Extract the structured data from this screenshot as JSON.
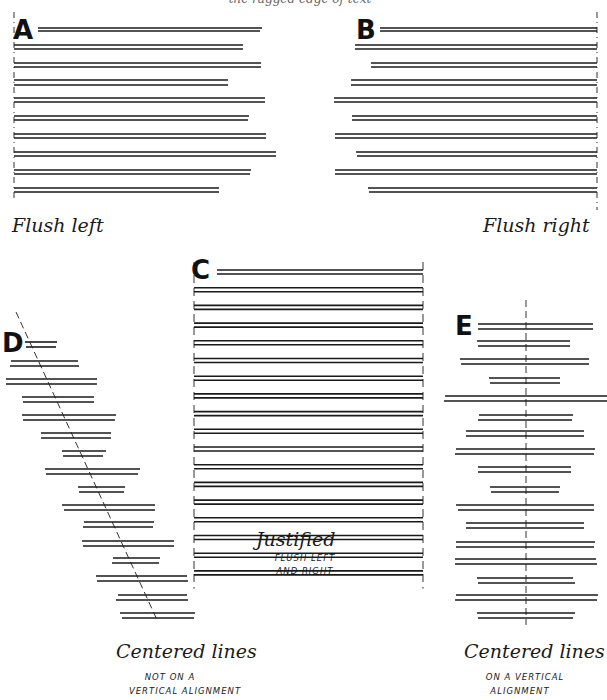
{
  "top_caption": "the ragged edge of text",
  "panels": {
    "A": {
      "letter": "A",
      "title": "Flush left",
      "align": "left",
      "axis_x": 14,
      "axis_y": [
        12,
        200
      ],
      "lines": [
        [
          [
            38,
            262,
            28
          ],
          [
            38,
            260,
            31
          ]
        ],
        [
          [
            14,
            243,
            45
          ],
          [
            14,
            243,
            49
          ]
        ],
        [
          [
            14,
            261,
            63
          ],
          [
            14,
            261,
            67
          ]
        ],
        [
          [
            14,
            228,
            80
          ],
          [
            14,
            228,
            85
          ]
        ],
        [
          [
            14,
            265,
            98
          ],
          [
            14,
            265,
            102
          ]
        ],
        [
          [
            14,
            249,
            116
          ],
          [
            14,
            248,
            120
          ]
        ],
        [
          [
            14,
            266,
            134
          ],
          [
            14,
            266,
            138
          ]
        ],
        [
          [
            14,
            276,
            152
          ],
          [
            14,
            276,
            156
          ]
        ],
        [
          [
            14,
            251,
            170
          ],
          [
            14,
            250,
            174
          ]
        ],
        [
          [
            14,
            219,
            188
          ],
          [
            14,
            219,
            192
          ]
        ]
      ]
    },
    "B": {
      "letter": "B",
      "title": "Flush right",
      "align": "right",
      "axis_x": 597,
      "axis_y": [
        12,
        210
      ],
      "lines": [
        [
          [
            380,
            597,
            28
          ],
          [
            380,
            597,
            31
          ]
        ],
        [
          [
            355,
            597,
            45
          ],
          [
            355,
            597,
            49
          ]
        ],
        [
          [
            371,
            597,
            63
          ],
          [
            371,
            597,
            67
          ]
        ],
        [
          [
            351,
            597,
            80
          ],
          [
            351,
            597,
            85
          ]
        ],
        [
          [
            334,
            597,
            98
          ],
          [
            334,
            597,
            102
          ]
        ],
        [
          [
            352,
            597,
            116
          ],
          [
            352,
            597,
            120
          ]
        ],
        [
          [
            335,
            597,
            134
          ],
          [
            335,
            597,
            138
          ]
        ],
        [
          [
            356,
            597,
            152
          ],
          [
            357,
            597,
            156
          ]
        ],
        [
          [
            335,
            597,
            170
          ],
          [
            335,
            597,
            174
          ]
        ],
        [
          [
            368,
            597,
            188
          ],
          [
            369,
            597,
            192
          ]
        ]
      ]
    },
    "C": {
      "letter": "C",
      "title": "Justified",
      "subtitle_lines": [
        "FLUSH LEFT",
        "AND RIGHT"
      ],
      "align": "justified",
      "left_x": 194,
      "right_x": 423,
      "lines_count": 18,
      "first_y": 270,
      "spacing": 17.7
    },
    "D": {
      "letter": "D",
      "title": "Centered lines",
      "subtitle_lines": [
        "NOT ON A",
        "VERTICAL ALIGNMENT"
      ],
      "align": "centered-diagonal",
      "axis": [
        [
          16,
          312
        ],
        [
          158,
          622
        ]
      ],
      "lines": [
        [
          [
            25,
            57,
            342
          ],
          [
            26,
            56,
            347
          ]
        ],
        [
          [
            11,
            78,
            361
          ],
          [
            10,
            79,
            366
          ]
        ],
        [
          [
            6,
            97,
            379
          ],
          [
            6,
            97,
            384
          ]
        ],
        [
          [
            22,
            94,
            397
          ],
          [
            23,
            94,
            402
          ]
        ],
        [
          [
            22,
            116,
            415
          ],
          [
            23,
            115,
            420
          ]
        ],
        [
          [
            41,
            111,
            433
          ],
          [
            41,
            111,
            438
          ]
        ],
        [
          [
            62,
            106,
            451
          ],
          [
            63,
            103,
            456
          ]
        ],
        [
          [
            45,
            140,
            469
          ],
          [
            46,
            138,
            474
          ]
        ],
        [
          [
            78,
            125,
            487
          ],
          [
            79,
            124,
            492
          ]
        ],
        [
          [
            62,
            155,
            505
          ],
          [
            64,
            155,
            510
          ]
        ],
        [
          [
            84,
            154,
            522
          ],
          [
            83,
            153,
            527
          ]
        ],
        [
          [
            82,
            174,
            541
          ],
          [
            83,
            174,
            546
          ]
        ],
        [
          [
            113,
            160,
            558
          ],
          [
            112,
            159,
            563
          ]
        ],
        [
          [
            96,
            187,
            576
          ],
          [
            97,
            188,
            581
          ]
        ],
        [
          [
            118,
            187,
            595
          ],
          [
            116,
            188,
            600
          ]
        ],
        [
          [
            120,
            195,
            613
          ],
          [
            122,
            194,
            618
          ]
        ]
      ]
    },
    "E": {
      "letter": "E",
      "title": "Centered lines",
      "subtitle_lines": [
        "ON A VERTICAL",
        "ALIGNMENT"
      ],
      "align": "centered-vertical",
      "axis_x": 526,
      "axis_y": [
        300,
        625
      ],
      "lines": [
        [
          [
            478,
            593,
            324
          ],
          [
            478,
            593,
            329
          ]
        ],
        [
          [
            477,
            570,
            341
          ],
          [
            478,
            570,
            346
          ]
        ],
        [
          [
            460,
            589,
            359
          ],
          [
            461,
            589,
            364
          ]
        ],
        [
          [
            489,
            560,
            378
          ],
          [
            490,
            560,
            383
          ]
        ],
        [
          [
            445,
            607,
            396
          ],
          [
            444,
            607,
            401
          ]
        ],
        [
          [
            479,
            573,
            415
          ],
          [
            478,
            572,
            420
          ]
        ],
        [
          [
            466,
            584,
            431
          ],
          [
            466,
            584,
            436
          ]
        ],
        [
          [
            456,
            595,
            449
          ],
          [
            455,
            594,
            454
          ]
        ],
        [
          [
            478,
            571,
            467
          ],
          [
            478,
            571,
            472
          ]
        ],
        [
          [
            490,
            560,
            487
          ],
          [
            491,
            559,
            492
          ]
        ],
        [
          [
            456,
            594,
            505
          ],
          [
            458,
            594,
            510
          ]
        ],
        [
          [
            466,
            584,
            523
          ],
          [
            466,
            584,
            528
          ]
        ],
        [
          [
            456,
            595,
            542
          ],
          [
            456,
            594,
            547
          ]
        ],
        [
          [
            455,
            596,
            559
          ],
          [
            455,
            597,
            564
          ]
        ],
        [
          [
            477,
            573,
            578
          ],
          [
            478,
            575,
            583
          ]
        ],
        [
          [
            456,
            598,
            595
          ],
          [
            455,
            597,
            600
          ]
        ],
        [
          [
            477,
            575,
            613
          ],
          [
            478,
            573,
            618
          ]
        ]
      ]
    }
  },
  "colors": {
    "ink": "#1a1a1a",
    "paper": "#ffffff",
    "guide": "#333333"
  }
}
